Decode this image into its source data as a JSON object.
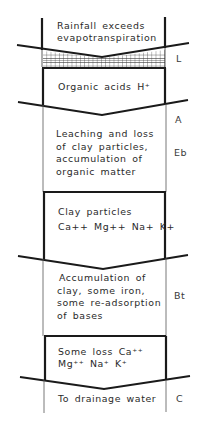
{
  "diagram": {
    "sections": [
      {
        "id": "input",
        "lines": [
          "Rainfall exceeds",
          "evapotranspiration"
        ]
      },
      {
        "id": "organic-acids",
        "lines": [
          "Organic acids H⁺"
        ]
      },
      {
        "id": "leaching",
        "lines": [
          "Leaching and loss",
          "of clay particles,",
          "accumulation of",
          "organic matter"
        ]
      },
      {
        "id": "clay-particles",
        "lines": [
          "Clay particles",
          "Ca++ Mg++ Na+ K+"
        ]
      },
      {
        "id": "accumulation",
        "lines": [
          "Accumulation of",
          "clay, some iron,",
          "some re-adsorption",
          "of bases"
        ]
      },
      {
        "id": "some-loss",
        "lines": [
          "Some loss Ca⁺⁺",
          "Mg⁺⁺  Na⁺  K⁺"
        ]
      },
      {
        "id": "drainage",
        "lines": [
          "To drainage water"
        ]
      }
    ],
    "horizon_labels": [
      {
        "label": "L"
      },
      {
        "label": "A"
      },
      {
        "label": "Eb"
      },
      {
        "label": "Bt"
      },
      {
        "label": "C"
      }
    ],
    "colors": {
      "line": "#1a1a1a",
      "thin_line": "#555555",
      "text": "#2a2a2a",
      "background": "#ffffff"
    }
  }
}
